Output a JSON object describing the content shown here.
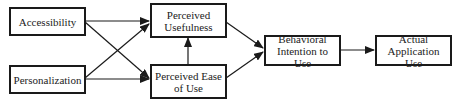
{
  "diagram": {
    "nodes": {
      "accessibility": {
        "label": "Accessibility"
      },
      "personalization": {
        "label": "Personalization"
      },
      "perceived_usefulness": {
        "line1": "Perceived",
        "line2": "Usefulness"
      },
      "perceived_ease": {
        "line1": "Perceived Ease",
        "line2": "of Use"
      },
      "behavioral_intention": {
        "line1": "Behavioral",
        "line2": "Intention to Use"
      },
      "actual_use": {
        "line1": "Actual",
        "line2": "Application Use"
      }
    },
    "edges": [
      {
        "from": "Accessibility",
        "to": "Perceived Usefulness"
      },
      {
        "from": "Accessibility",
        "to": "Perceived Ease of Use"
      },
      {
        "from": "Personalization",
        "to": "Perceived Usefulness"
      },
      {
        "from": "Personalization",
        "to": "Perceived Ease of Use"
      },
      {
        "from": "Perceived Ease of Use",
        "to": "Perceived Usefulness"
      },
      {
        "from": "Perceived Usefulness",
        "to": "Behavioral Intention to Use"
      },
      {
        "from": "Perceived Ease of Use",
        "to": "Behavioral Intention to Use"
      },
      {
        "from": "Behavioral Intention to Use",
        "to": "Actual Application Use"
      }
    ],
    "colors": {
      "stroke": "#1a1a1a",
      "text": "#222222",
      "background": "#ffffff"
    }
  }
}
